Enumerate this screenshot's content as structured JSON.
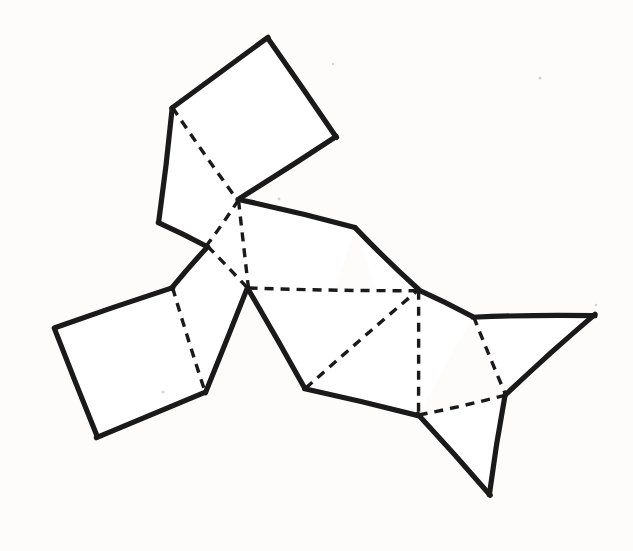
{
  "document": {
    "title": "Polyhedron Net Line Drawing",
    "kind": "line-diagram",
    "description": "Hand-drawn net (unfolding) of a polyhedron composed of chained quadrilateral and triangular faces",
    "background_color": "#fbfaf8",
    "ink_color": "#1a1a1a",
    "paper_color": "#ffffff",
    "canvas": {
      "width": 633,
      "height": 551
    }
  },
  "legend": {
    "cut_edge_style": "solid",
    "fold_edge_style": "dashed",
    "cut_stroke_width": 5.2,
    "fold_stroke_width": 3.4,
    "fold_dash_pattern": "9 7"
  },
  "figure": {
    "vertices": {
      "a_top_left": [
        172,
        108
      ],
      "a_apex": [
        268,
        38
      ],
      "a_right": [
        336,
        137
      ],
      "center_upper": [
        238,
        200
      ],
      "left_elbow": [
        158,
        222
      ],
      "left_lower": [
        207,
        246
      ],
      "bl_top": [
        172,
        288
      ],
      "bl_left": [
        55,
        328
      ],
      "bl_bottom": [
        97,
        437
      ],
      "bl_right": [
        205,
        393
      ],
      "center_apex": [
        248,
        288
      ],
      "mid_right_top": [
        355,
        228
      ],
      "mid_right_elbow": [
        418,
        290
      ],
      "bottom_center": [
        305,
        388
      ],
      "bottom_mid_right": [
        418,
        415
      ],
      "dart_top_left": [
        473,
        317
      ],
      "dart_top_right": [
        595,
        315
      ],
      "dart_inner": [
        505,
        395
      ],
      "dart_tail": [
        490,
        495
      ]
    },
    "faces": [
      {
        "id": "face-top-square",
        "label": "upper square face",
        "polygon": "172,108 268,38 336,137 238,200",
        "cut_edges": [
          "172,108 268,38",
          "268,38 336,137",
          "336,137 238,200"
        ],
        "fold_edges": [
          "172,108 238,200"
        ]
      },
      {
        "id": "face-left-quad",
        "label": "left upper quadrilateral face",
        "polygon": "172,108 238,200 207,246 158,222",
        "cut_edges": [
          "172,108 158,222",
          "158,222 207,246"
        ],
        "fold_edges": [
          "172,108 238,200",
          "238,200 207,246"
        ]
      },
      {
        "id": "face-center-quad",
        "label": "central quadrilateral face",
        "polygon": "238,200 207,246 172,288 248,288",
        "cut_edges": [
          "238,200 355,228"
        ],
        "fold_edges": [
          "207,246 248,288",
          "238,200 207,246"
        ]
      },
      {
        "id": "face-left-lower-quad",
        "label": "left connector quadrilateral face",
        "polygon": "207,246 172,288 205,393 248,288",
        "cut_edges": [
          "207,246 172,288",
          "248,288 205,393"
        ],
        "fold_edges": [
          "172,288 205,393"
        ]
      },
      {
        "id": "face-bottom-left-square",
        "label": "bottom-left square face",
        "polygon": "172,288 55,328 97,437 205,393",
        "cut_edges": [
          "172,288 55,328",
          "55,328 97,437",
          "97,437 205,393"
        ],
        "fold_edges": [
          "172,288 205,393"
        ]
      },
      {
        "id": "face-mid-right-quad",
        "label": "middle-right quadrilateral face",
        "polygon": "238,200 355,228 305,388 248,288",
        "cut_edges": [
          "238,200 355,228"
        ],
        "fold_edges": [
          "248,288 305,388",
          "238,200 248,288"
        ]
      },
      {
        "id": "face-lower-center-quad",
        "label": "lower-centre quadrilateral face",
        "polygon": "248,288 305,388 418,415 418,290",
        "cut_edges": [
          "248,288 305,388",
          "305,388 418,415"
        ],
        "fold_edges": [
          "305,388 418,290"
        ]
      },
      {
        "id": "face-right-quad",
        "label": "right connector quadrilateral face",
        "polygon": "355,228 418,290 473,317 418,415",
        "cut_edges": [
          "355,228 418,290",
          "418,290 473,317"
        ],
        "fold_edges": [
          "418,290 418,415",
          "418,415 505,395"
        ]
      },
      {
        "id": "face-dart-upper-triangle",
        "label": "upper-right triangular face",
        "polygon": "473,317 595,315 505,395",
        "cut_edges": [
          "473,317 595,315",
          "595,315 505,395"
        ],
        "fold_edges": [
          "473,317 505,395"
        ]
      },
      {
        "id": "face-dart-lower-triangle",
        "label": "lower-right triangular tail face",
        "polygon": "418,415 490,495 505,395",
        "cut_edges": [
          "418,415 490,495",
          "490,495 505,395"
        ],
        "fold_edges": [
          "418,415 505,395"
        ]
      }
    ],
    "solid_strokes": [
      {
        "name": "top-square-left-upper",
        "points": "172,108 268,38"
      },
      {
        "name": "top-square-right-upper",
        "points": "268,38 336,137"
      },
      {
        "name": "top-square-lower-right",
        "points": "336,137 238,200"
      },
      {
        "name": "left-quad-outer-left",
        "points": "172,108 158,222"
      },
      {
        "name": "left-quad-lower-left",
        "points": "158,222 207,246"
      },
      {
        "name": "center-to-mid-right",
        "points": "238,200 355,228"
      },
      {
        "name": "mid-right-down",
        "points": "355,228 418,290"
      },
      {
        "name": "left-lower-to-bl-top",
        "points": "207,246 172,288"
      },
      {
        "name": "bl-square-top",
        "points": "172,288 55,328"
      },
      {
        "name": "bl-square-left",
        "points": "55,328 97,437"
      },
      {
        "name": "bl-square-bottom",
        "points": "97,437 205,393"
      },
      {
        "name": "center-apex-to-bl-right",
        "points": "248,288 205,393"
      },
      {
        "name": "center-apex-to-bottom-center",
        "points": "248,288 305,388"
      },
      {
        "name": "bottom-center-to-bottom-mid-right",
        "points": "305,388 418,415"
      },
      {
        "name": "mid-right-elbow-to-dart",
        "points": "418,290 473,317"
      },
      {
        "name": "dart-top-edge",
        "points": "473,317 595,315"
      },
      {
        "name": "dart-right-edge",
        "points": "595,315 505,395"
      },
      {
        "name": "dart-inner-to-tail",
        "points": "505,395 490,495"
      },
      {
        "name": "tail-to-bottom-mid-right",
        "points": "490,495 418,415"
      }
    ],
    "dashed_strokes": [
      {
        "name": "fold-top-square-diagonal",
        "points": "172,108 238,200"
      },
      {
        "name": "fold-center-upper-to-left-lower",
        "points": "238,200 207,246"
      },
      {
        "name": "fold-left-lower-to-center-apex",
        "points": "207,246 248,288"
      },
      {
        "name": "fold-center-upper-to-center-apex",
        "points": "238,200 248,288"
      },
      {
        "name": "fold-bl-square-right",
        "points": "172,288 205,393"
      },
      {
        "name": "fold-center-apex-to-mid-right-elbow",
        "points": "248,288 418,290"
      },
      {
        "name": "fold-bottom-center-to-mid-right-elbow",
        "points": "305,388 418,290"
      },
      {
        "name": "fold-mid-right-elbow-to-bottom-mid-right",
        "points": "418,290 418,415"
      },
      {
        "name": "fold-dart-top-left-to-inner",
        "points": "473,317 505,395"
      },
      {
        "name": "fold-bottom-mid-right-to-dart-inner",
        "points": "418,415 505,395"
      }
    ],
    "specks": [
      {
        "x": 540,
        "y": 78,
        "r": 1.6
      },
      {
        "x": 279,
        "y": 199,
        "r": 1.4
      },
      {
        "x": 596,
        "y": 305,
        "r": 1.3
      },
      {
        "x": 163,
        "y": 392,
        "r": 1.5
      },
      {
        "x": 333,
        "y": 64,
        "r": 1.2
      }
    ]
  }
}
